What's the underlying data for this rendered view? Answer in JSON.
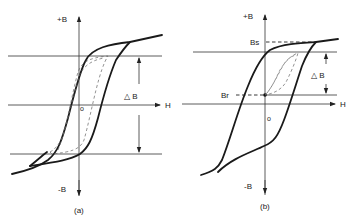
{
  "figure": {
    "panel_a": {
      "caption": "(a)",
      "y_axis_top_label": "+B",
      "y_axis_bottom_label": "-B",
      "x_axis_label": "H",
      "delta_label": "△ B",
      "origin_label": "o"
    },
    "panel_b": {
      "caption": "(b)",
      "y_axis_top_label": "+B",
      "y_axis_bottom_label": "-B",
      "x_axis_label": "H",
      "delta_label": "△ B",
      "origin_label": "o",
      "saturation_label": "Bs",
      "remanence_label": "Br"
    }
  }
}
